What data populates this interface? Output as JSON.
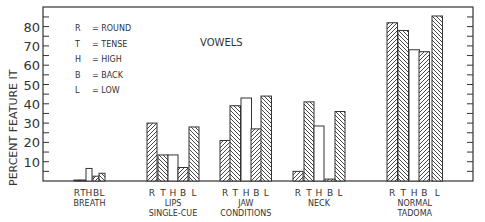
{
  "chart_data": {
    "type": "bar",
    "title": "VOWELS",
    "xlabel": "",
    "ylabel": "PERCENT FEATURE IT",
    "ylim": [
      0,
      90
    ],
    "yticks": [
      10,
      20,
      30,
      40,
      50,
      60,
      70,
      80
    ],
    "grid": false,
    "legend": {
      "position": "upper-left",
      "entries": [
        {
          "key": "R",
          "text": "= ROUND"
        },
        {
          "key": "T",
          "text": "= TENSE"
        },
        {
          "key": "H",
          "text": "= HIGH"
        },
        {
          "key": "B",
          "text": "= BACK"
        },
        {
          "key": "L",
          "text": "= LOW"
        }
      ]
    },
    "features": [
      "R",
      "T",
      "H",
      "B",
      "L"
    ],
    "categories": [
      {
        "label_lines": [
          "BREATH"
        ],
        "values": [
          0.5,
          0.5,
          6.5,
          2.5,
          4
        ]
      },
      {
        "label_lines": [
          "LIPS",
          "SINGLE-CUE"
        ],
        "values": [
          30,
          13.5,
          13.5,
          7,
          28
        ]
      },
      {
        "label_lines": [
          "JAW",
          "CONDITIONS"
        ],
        "values": [
          21,
          39,
          43,
          27,
          44
        ]
      },
      {
        "label_lines": [
          "NECK"
        ],
        "values": [
          5,
          41,
          28.5,
          1,
          36
        ]
      },
      {
        "label_lines": [
          "NORMAL",
          "TADOMA"
        ],
        "values": [
          82,
          78,
          68,
          67,
          85.5
        ]
      }
    ],
    "series": [
      {
        "name": "R",
        "pattern": "hatch-forward",
        "values": [
          0.5,
          30,
          21,
          5,
          82
        ]
      },
      {
        "name": "T",
        "pattern": "hatch-back",
        "values": [
          0.5,
          13.5,
          39,
          41,
          78
        ]
      },
      {
        "name": "H",
        "pattern": "empty",
        "values": [
          6.5,
          13.5,
          43,
          28.5,
          68
        ]
      },
      {
        "name": "B",
        "pattern": "hatch-forward",
        "values": [
          2.5,
          7,
          27,
          1,
          67
        ]
      },
      {
        "name": "L",
        "pattern": "hatch-back",
        "values": [
          4,
          28,
          44,
          36,
          85.5
        ]
      }
    ]
  },
  "colors": {
    "ink": "#333333",
    "background": "#ffffff"
  }
}
